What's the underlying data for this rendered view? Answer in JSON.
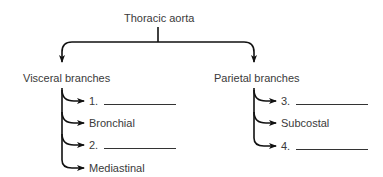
{
  "diagram": {
    "root": "Thoracic aorta",
    "groups": [
      {
        "label": "Visceral branches",
        "items": [
          {
            "text": "1.",
            "blank": true
          },
          {
            "text": "Bronchial",
            "blank": false
          },
          {
            "text": "2.",
            "blank": true
          },
          {
            "text": "Mediastinal",
            "blank": false
          }
        ]
      },
      {
        "label": "Parietal branches",
        "items": [
          {
            "text": "3.",
            "blank": true
          },
          {
            "text": "Subcostal",
            "blank": false
          },
          {
            "text": "4.",
            "blank": true
          }
        ]
      }
    ]
  }
}
